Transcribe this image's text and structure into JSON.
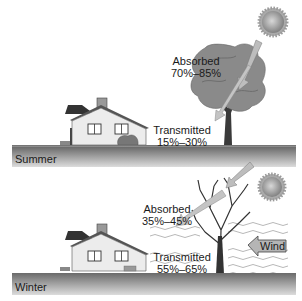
{
  "summer": {
    "season_label": "Summer",
    "absorbed": {
      "label": "Absorbed",
      "value": "70%–85%"
    },
    "transmitted": {
      "label": "Transmitted",
      "value": "15%–30%"
    },
    "tree": "leafy-deciduous-tree"
  },
  "winter": {
    "season_label": "Winter",
    "absorbed": {
      "label": "Absorbed",
      "value": "35%–45%"
    },
    "transmitted": {
      "label": "Transmitted",
      "value": "55%–65%"
    },
    "wind_label": "Wind",
    "tree": "bare-deciduous-tree"
  },
  "colors": {
    "ground_dark": "#6b6b6b",
    "ground_light": "#d8d8d8",
    "arrow_fill": "#b8b8b8",
    "tree_canopy": "#8a8a8a",
    "sun": "#999999"
  }
}
